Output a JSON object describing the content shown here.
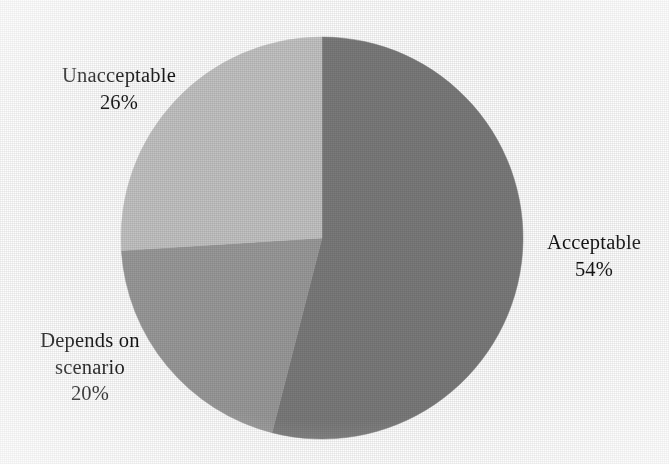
{
  "figure": {
    "background_color": "#fdfdfd",
    "text_color": "#141414"
  },
  "chart_data": {
    "type": "pie",
    "title": "",
    "subtitle": "",
    "xlabel": "",
    "ylabel": "",
    "legend_position": "none",
    "grid": false,
    "labels_inline": true,
    "start_angle_deg": 0,
    "direction": "clockwise",
    "center_px": [
      322,
      238
    ],
    "radius_px": 201,
    "categories": [
      "Acceptable",
      "Depends on scenario",
      "Unacceptable"
    ],
    "values": [
      54,
      20,
      26
    ],
    "unit": "%",
    "slices": [
      {
        "label": "Acceptable",
        "value": 54,
        "value_text": "54%",
        "color": "#7b7b7b",
        "start_angle_deg": 0,
        "end_angle_deg": 194.4
      },
      {
        "label": "Depends on scenario",
        "label_lines": [
          "Depends on",
          "scenario"
        ],
        "value": 20,
        "value_text": "20%",
        "color": "#9a9a9a",
        "start_angle_deg": 194.4,
        "end_angle_deg": 266.4
      },
      {
        "label": "Unacceptable",
        "value": 26,
        "value_text": "26%",
        "color": "#c3c3c3",
        "start_angle_deg": 266.4,
        "end_angle_deg": 360
      }
    ]
  },
  "labels": {
    "unacceptable": {
      "name": "Unacceptable",
      "value": "26%"
    },
    "acceptable": {
      "name": "Acceptable",
      "value": "54%"
    },
    "depends": {
      "name_line1": "Depends on",
      "name_line2": "scenario",
      "value": "20%"
    }
  }
}
